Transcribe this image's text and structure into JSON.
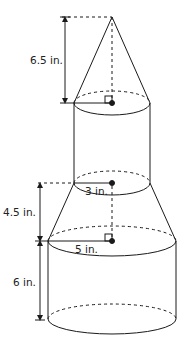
{
  "figure": {
    "labels": {
      "cone_height": "6.5 in.",
      "upper_radius": "3 in.",
      "frustum_height": "4.5 in.",
      "lower_radius": "5 in.",
      "lower_cylinder_height": "6 in."
    },
    "colors": {
      "stroke": "#1a1a1a",
      "text": "#222222",
      "background": "#ffffff"
    }
  }
}
